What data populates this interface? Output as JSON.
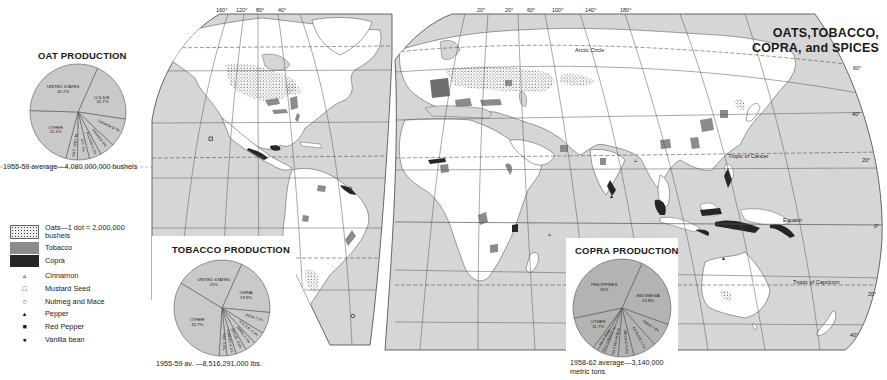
{
  "map": {
    "title_line1": "OATS,TOBACCO,",
    "title_line2": "COPRA, and SPICES",
    "colors": {
      "ocean": "#d6d6d6",
      "land": "#ffffff",
      "tobacco": "#8b8b8b",
      "copra": "#262626",
      "oats_dot": "#3a3a3a",
      "grid": "#555555",
      "pie_fill": "#c9c9c9"
    },
    "longitude_labels_west": [
      "160°",
      "120°",
      "80°",
      "40°"
    ],
    "longitude_labels_east": [
      "20°",
      "20°",
      "60°",
      "100°",
      "140°",
      "180°"
    ],
    "latitude_labels": [
      "60°",
      "40°",
      "20°",
      "0°",
      "20°",
      "40°"
    ],
    "lines": {
      "arctic_circle": "Arctic Circle",
      "tropic_cancer": "Tropic of Cancer",
      "equator": "Equator",
      "tropic_capricorn": "Tropic of Capricorn"
    }
  },
  "legend": {
    "items": [
      {
        "symbol": "oats-swatch",
        "label_line1": "Oats—1 dot = 2,000,000",
        "label_line2": "bushels"
      },
      {
        "symbol": "tobacco-swatch",
        "label_line1": "Tobacco"
      },
      {
        "symbol": "copra-swatch",
        "label_line1": "Copra"
      },
      {
        "symbol": "▵",
        "label_line1": "Cinnamon"
      },
      {
        "symbol": "□",
        "label_line1": "Mustard Seed"
      },
      {
        "symbol": "○",
        "label_line1": "Nutmeg and Mace"
      },
      {
        "symbol": "▴",
        "label_line1": "Pepper"
      },
      {
        "symbol": "■",
        "label_line1": "Red Pepper"
      },
      {
        "symbol": "●",
        "label_line1": "Vanilla bean"
      }
    ]
  },
  "chart_data": [
    {
      "type": "pie",
      "title": "OAT PRODUCTION",
      "caption": "1955-59 average—4,080,000,000 bushels",
      "categories": [
        "U.S.S.R.",
        "CANADA",
        "FRANCE",
        "POLAND",
        "U.K.",
        "W. GER.",
        "OTHER",
        "UNITED STATES"
      ],
      "values": [
        20.7,
        9.7,
        5.0,
        4.1,
        4.0,
        3.9,
        21.4,
        31.2
      ],
      "unit": "%"
    },
    {
      "type": "pie",
      "title": "TOBACCO PRODUCTION",
      "caption": "1955-59 av. —8,516,291,000 lbs.",
      "categories": [
        "CHINA",
        "INDIA",
        "U.S.S.R.",
        "JAPAN",
        "BRAZIL",
        "TURKEY",
        "PAK.",
        "OTHER",
        "UNITED STATES"
      ],
      "values": [
        19.8,
        7.3,
        4.2,
        3.7,
        3.6,
        3.1,
        2.6,
        32.7,
        23.0
      ],
      "unit": "%"
    },
    {
      "type": "pie",
      "title": "COPRA PRODUCTION",
      "caption_line1": "1958-62 average—3,140,000",
      "caption_line2": "metric tons",
      "categories": [
        "INDONESIA",
        "INDIA",
        "CEYLON",
        "MEXICO",
        "MALAYSIA",
        "N. GUINEA",
        "MOZ.",
        "OTHER",
        "PHILIPPINES"
      ],
      "values": [
        23.8,
        7.9,
        7.7,
        5.2,
        4.5,
        2.5,
        1.7,
        11.7,
        35.0
      ],
      "unit": "%"
    }
  ]
}
